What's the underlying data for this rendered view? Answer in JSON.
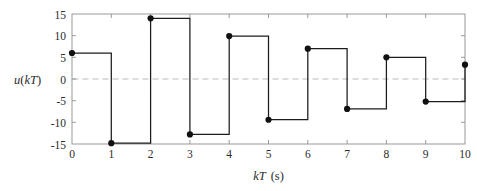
{
  "chart_data": {
    "type": "line",
    "subtype": "zero-order-hold-staircase",
    "title": "",
    "xlabel": "kT (s)",
    "ylabel": "u(kT)",
    "x": [
      0,
      1,
      2,
      3,
      4,
      5,
      6,
      7,
      8,
      9,
      10
    ],
    "values": [
      6.0,
      -14.8,
      14.0,
      -12.8,
      9.9,
      -9.4,
      7.0,
      -6.9,
      5.0,
      -5.2,
      3.3
    ],
    "series": [
      {
        "name": "u(kT)",
        "values": [
          6.0,
          -14.8,
          14.0,
          -12.8,
          9.9,
          -9.4,
          7.0,
          -6.9,
          5.0,
          -5.2,
          3.3
        ]
      }
    ],
    "xlim": [
      0,
      10
    ],
    "ylim": [
      -15,
      15
    ],
    "xticks": [
      0,
      1,
      2,
      3,
      4,
      5,
      6,
      7,
      8,
      9,
      10
    ],
    "yticks": [
      15,
      10,
      5,
      0,
      -5,
      -10,
      -15
    ],
    "xtick_labels": [
      "0",
      "1",
      "2",
      "3",
      "4",
      "5",
      "6",
      "7",
      "8",
      "9",
      "10"
    ],
    "ytick_labels": [
      "15",
      "10",
      "5",
      "0",
      "-5",
      "-10",
      "-15"
    ],
    "grid": false,
    "zero_line": true,
    "legend": "none",
    "markers": "filled-circle",
    "colors": {
      "line": "#1c1c1c",
      "marker": "#111111",
      "frame": "#8e8e8e",
      "zero_line": "#b9b9b9",
      "background": "#ffffff",
      "text": "#2b2b2b"
    }
  },
  "axis": {
    "y_title_math": "u(kT)",
    "y_title_func": "u",
    "y_title_open": "(",
    "y_title_var": "kT",
    "y_title_close": ")",
    "x_title_var": "kT",
    "x_title_unit": "(s)"
  }
}
